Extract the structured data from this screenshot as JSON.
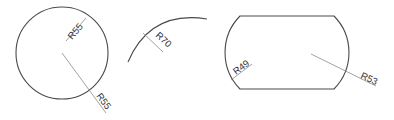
{
  "drawing": {
    "colors": {
      "outline": "#4a4a4a",
      "leader": "#8a8a8a",
      "text": "#333333",
      "background": "#ffffff"
    },
    "circle": {
      "dimensions": [
        {
          "label": "R55",
          "placement": "inside"
        },
        {
          "label": "R55",
          "placement": "outside"
        }
      ]
    },
    "arc": {
      "dimensions": [
        {
          "label": "R70",
          "placement": "inside"
        }
      ]
    },
    "obround": {
      "dimensions": [
        {
          "label": "R49",
          "placement": "left-arc-inside"
        },
        {
          "label": "R53",
          "placement": "right-arc-outside"
        }
      ]
    }
  }
}
